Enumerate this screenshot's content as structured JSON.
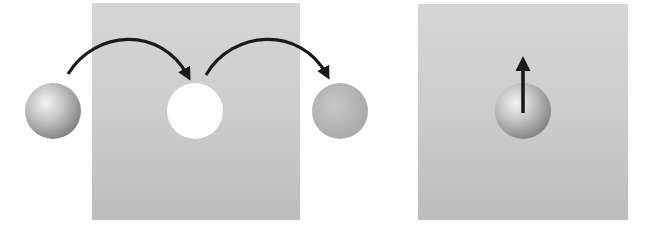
{
  "diagram": {
    "colors": {
      "background": "#ffffff",
      "slab_top": "#d4d4d4",
      "slab_bottom": "#bdbdbd",
      "arrow": "#1a1a1a",
      "vacancy": "#ffffff",
      "sphere_light": "#f2f2f2",
      "sphere_dark": "#8a8a8a",
      "faded_sphere": "#b4b4b4"
    },
    "left_panel": {
      "slab": {
        "x": 92,
        "y": 3,
        "width": 208,
        "height": 217
      },
      "incoming_sphere": {
        "cx": 53,
        "cy": 111,
        "r": 28
      },
      "vacancy": {
        "cx": 195,
        "cy": 111,
        "r": 28
      },
      "outgoing_sphere": {
        "cx": 340,
        "cy": 111,
        "r": 28
      },
      "arrows": [
        {
          "name": "hop-into-vacancy",
          "from": [
            68,
            74
          ],
          "to": [
            190,
            80
          ]
        },
        {
          "name": "hop-out-of-vacancy",
          "from": [
            206,
            75
          ],
          "to": [
            329,
            79
          ]
        }
      ]
    },
    "right_panel": {
      "slab": {
        "x": 418,
        "y": 4,
        "width": 210,
        "height": 216
      },
      "sphere": {
        "cx": 523,
        "cy": 111,
        "r": 28
      },
      "arrow": {
        "name": "upward-displacement",
        "from": [
          523,
          113
        ],
        "to": [
          523,
          56
        ]
      }
    }
  }
}
